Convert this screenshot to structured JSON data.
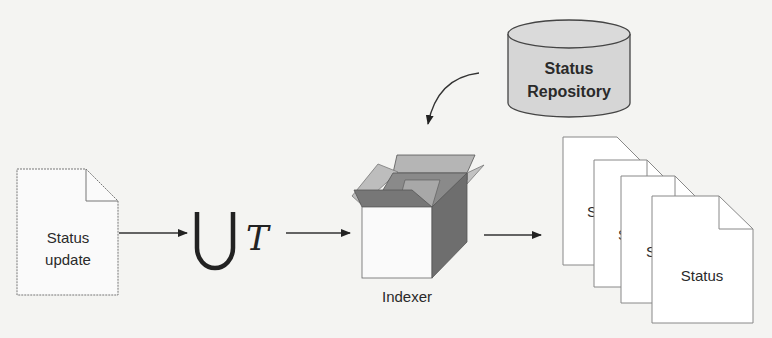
{
  "diagram": {
    "input_doc": {
      "line1": "Status",
      "line2": "update"
    },
    "operator": {
      "union_symbol": "⋃",
      "variable": "T"
    },
    "indexer": {
      "label": "Indexer"
    },
    "repository": {
      "line1": "Status",
      "line2": "Repository"
    },
    "output_docs": {
      "partial_labels": [
        "S",
        "S",
        "S"
      ],
      "front_label": "Status"
    },
    "colors": {
      "background": "#f4f4f2",
      "stroke": "#555555",
      "arrow": "#222222",
      "box_dark": "#6e6e6e",
      "box_mid": "#8a8a8a",
      "box_light": "#b5b5b5",
      "cylinder_fill": "#d6d6d6",
      "doc_fill": "#ffffff"
    }
  }
}
